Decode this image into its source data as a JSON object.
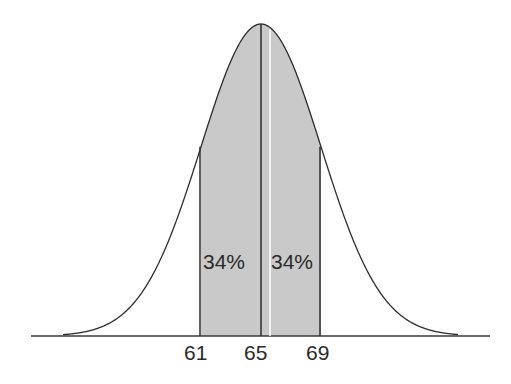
{
  "chart_data": {
    "type": "area",
    "title": "",
    "xlabel": "",
    "ylabel": "",
    "distribution": "normal",
    "mean": 65,
    "std_dev": 4,
    "x_ticks": [
      "61",
      "65",
      "69"
    ],
    "shaded_regions": [
      {
        "from": 61,
        "to": 65,
        "label": "34%",
        "percent": 34
      },
      {
        "from": 65,
        "to": 69,
        "label": "34%",
        "percent": 34
      }
    ],
    "grid": false,
    "legend": "none",
    "colors": {
      "curve": "#2b2b2b",
      "fill": "#c8c8c8",
      "baseline": "#3a3a3a"
    }
  },
  "labels": {
    "left_region": "34%",
    "right_region": "34%",
    "tick_61": "61",
    "tick_65": "65",
    "tick_69": "69"
  }
}
